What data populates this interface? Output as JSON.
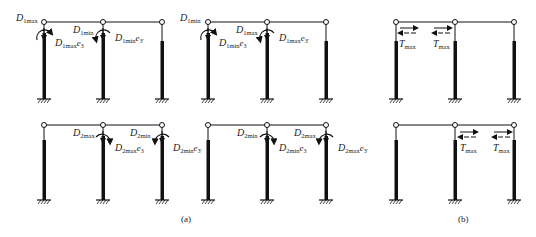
{
  "figure": {
    "panel_a_caption": "(a)",
    "panel_b_caption": "(b)"
  },
  "labels": {
    "f1_d1": "D",
    "f1_d1_sub": "1max",
    "f1_d1e": "D",
    "f1_d1e_sub": "1max",
    "f1_d1e_e": "e",
    "f1_d1e_esub": "3",
    "f1_d2": "D",
    "f1_d2_sub": "1min",
    "f1_d2e": "D",
    "f1_d2e_sub": "1min",
    "f1_d2e_e": "e",
    "f1_d2e_esub": "3'",
    "f2_d1": "D",
    "f2_d1_sub": "1min",
    "f2_d1e": "D",
    "f2_d1e_sub": "1min",
    "f2_d1e_e": "e",
    "f2_d1e_esub": "3",
    "f2_d2": "D",
    "f2_d2_sub": "1max",
    "f2_d2e": "D",
    "f2_d2e_sub": "1max",
    "f2_d2e_e": "e",
    "f2_d2e_esub": "3'",
    "f4_d1": "D",
    "f4_d1_sub": "2max",
    "f4_d1e": "D",
    "f4_d1e_sub": "2max",
    "f4_d1e_e": "e",
    "f4_d1e_esub": "3",
    "f4_d2": "D",
    "f4_d2_sub": "2min",
    "f4_d2e": "D",
    "f4_d2e_sub": "2min",
    "f4_d2e_e": "e",
    "f4_d2e_esub": "3'",
    "f5_d1": "D",
    "f5_d1_sub": "2min",
    "f5_d1e": "D",
    "f5_d1e_sub": "2min",
    "f5_d1e_e": "e",
    "f5_d1e_esub": "3",
    "f5_d2": "D",
    "f5_d2_sub": "2max",
    "f5_d2e": "D",
    "f5_d2e_sub": "2max",
    "f5_d2e_e": "e",
    "f5_d2e_esub": "3'",
    "t_main": "T",
    "t_sub": "max"
  },
  "colors": {
    "ink": "#111111",
    "background": "#ffffff"
  }
}
